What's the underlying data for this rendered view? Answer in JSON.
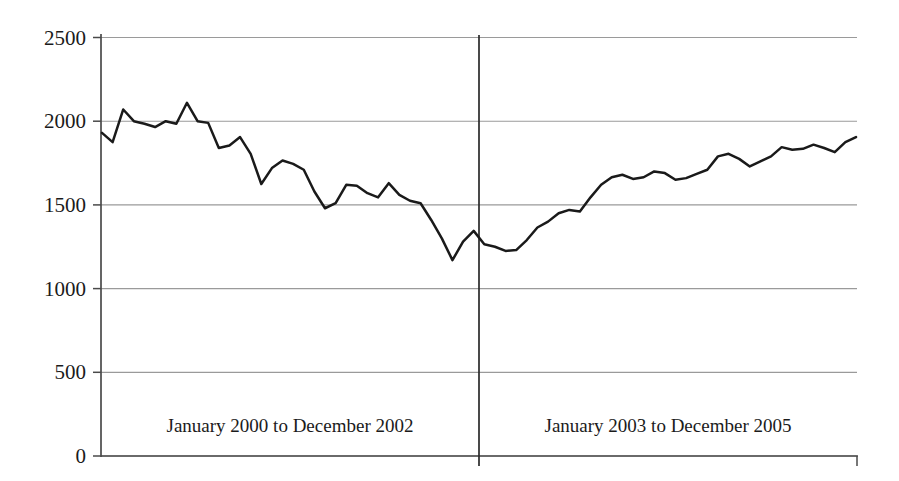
{
  "chart_data": {
    "type": "line",
    "title": "",
    "xlabel": "",
    "ylabel": "",
    "ylim": [
      0,
      2500
    ],
    "ytick_values": [
      0,
      500,
      1000,
      1500,
      2000,
      2500
    ],
    "ytick_labels": [
      "0",
      "500",
      "1000",
      "1500",
      "2000",
      "2500"
    ],
    "grid": true,
    "legend_position": "none",
    "x_count": 72,
    "x_start": "January 2000",
    "x_end": "December 2005",
    "series": [
      {
        "name": "Monthly value",
        "color": "#1a1a1a",
        "values": [
          1930,
          1875,
          2070,
          2000,
          1985,
          1965,
          2000,
          1985,
          2110,
          2000,
          1990,
          1840,
          1855,
          1905,
          1805,
          1625,
          1720,
          1765,
          1745,
          1710,
          1580,
          1480,
          1510,
          1620,
          1615,
          1570,
          1545,
          1630,
          1560,
          1525,
          1510,
          1410,
          1300,
          1170,
          1280,
          1345,
          1265,
          1250,
          1225,
          1230,
          1290,
          1365,
          1400,
          1450,
          1470,
          1460,
          1545,
          1620,
          1665,
          1680,
          1655,
          1665,
          1700,
          1690,
          1650,
          1660,
          1685,
          1710,
          1790,
          1805,
          1775,
          1730,
          1760,
          1790,
          1845,
          1830,
          1835,
          1860,
          1840,
          1815,
          1875,
          1905
        ]
      }
    ],
    "annotations": [
      {
        "name": "segment-1-caption",
        "text": "January 2000 to December 2002",
        "x_center": 290,
        "y": 432
      },
      {
        "name": "segment-2-caption",
        "text": "January 2003 to December 2005",
        "x_center": 668,
        "y": 432
      }
    ],
    "divider": {
      "name": "period-divider",
      "label": "January 2003 boundary",
      "x": 479
    },
    "colors": {
      "line": "#1a1a1a",
      "gridline": "#9a9a9a",
      "axis": "#4a4a4a",
      "divider": "#2a2a2a",
      "background": "#ffffff",
      "text": "#1b1b1b"
    }
  }
}
